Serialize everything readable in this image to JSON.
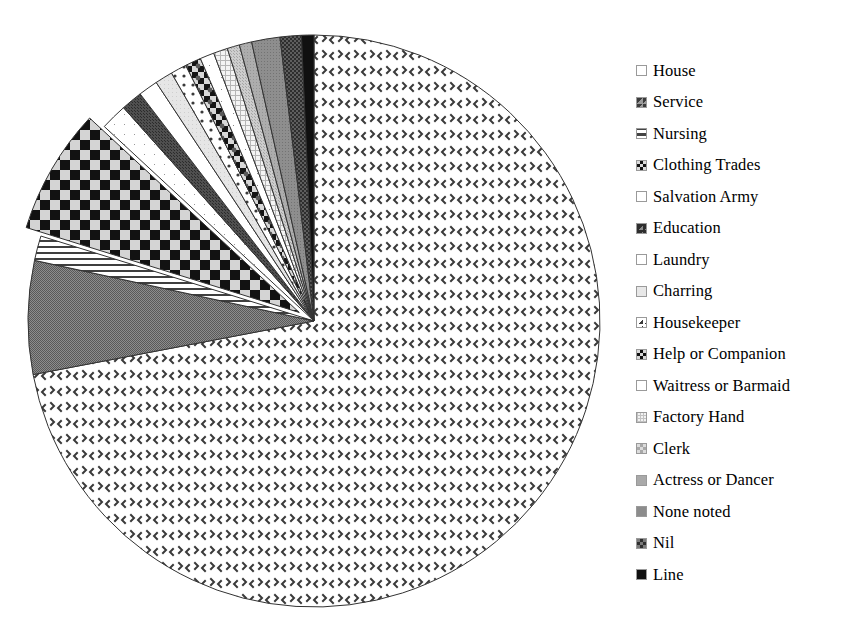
{
  "chart_data": {
    "type": "pie",
    "title": "",
    "subtitle": "",
    "xlabel": "",
    "ylabel": "",
    "legend_position": "right",
    "grid": false,
    "exploded_slices": [
      "Clothing Trades"
    ],
    "start_angle_deg": 90,
    "direction": "clockwise",
    "categories": [
      "House",
      "Service",
      "Nursing",
      "Clothing Trades",
      "Salvation Army",
      "Education",
      "Laundry",
      "Charring",
      "Housekeeper",
      "Help or Companion",
      "Waitress or Barmaid",
      "Factory Hand",
      "Clerk",
      "Actress or Dancer",
      "None noted",
      "Nil",
      "Line"
    ],
    "values": [
      72.0,
      6.4,
      1.4,
      7.1,
      1.5,
      1.2,
      1.1,
      1.0,
      0.9,
      0.9,
      0.8,
      0.8,
      0.7,
      0.7,
      1.6,
      1.2,
      0.7
    ],
    "units": "percent",
    "slices": [
      {
        "label": "House",
        "value": 72.0,
        "pattern": "sparse-chevron-dots",
        "fill": "#ffffff",
        "ink": "#3a3a3a"
      },
      {
        "label": "Service",
        "value": 6.4,
        "pattern": "dense-dither-50",
        "fill": "#777777",
        "ink": "#555555"
      },
      {
        "label": "Nursing",
        "value": 1.4,
        "pattern": "horizontal-lines",
        "fill": "#ffffff",
        "ink": "#444444"
      },
      {
        "label": "Clothing Trades",
        "value": 7.1,
        "pattern": "checkerboard-large",
        "fill": "#d0d0d0",
        "ink": "#111111"
      },
      {
        "label": "Salvation Army",
        "value": 1.5,
        "pattern": "open-white",
        "fill": "#ffffff",
        "ink": "#888888"
      },
      {
        "label": "Education",
        "value": 1.2,
        "pattern": "dark-dither-solid",
        "fill": "#4a4a4a",
        "ink": "#303030"
      },
      {
        "label": "Laundry",
        "value": 1.1,
        "pattern": "blank",
        "fill": "#ffffff",
        "ink": "#999999"
      },
      {
        "label": "Charring",
        "value": 1.0,
        "pattern": "light-gray-flat",
        "fill": "#e2e2e2",
        "ink": "#9a9a9a"
      },
      {
        "label": "Housekeeper",
        "value": 0.9,
        "pattern": "corner-block",
        "fill": "#ffffff",
        "ink": "#3a3a3a"
      },
      {
        "label": "Help or Companion",
        "value": 0.9,
        "pattern": "diagonal-checker-dark",
        "fill": "#cccccc",
        "ink": "#101010"
      },
      {
        "label": "Waitress or Barmaid",
        "value": 0.8,
        "pattern": "open-white",
        "fill": "#ffffff",
        "ink": "#8a8a8a"
      },
      {
        "label": "Factory Hand",
        "value": 0.8,
        "pattern": "fine-grid",
        "fill": "#f0f0f0",
        "ink": "#b0b0b0"
      },
      {
        "label": "Clerk",
        "value": 0.7,
        "pattern": "mid-gray-dither",
        "fill": "#c8c8c8",
        "ink": "#a0a0a0"
      },
      {
        "label": "Actress or Dancer",
        "value": 0.7,
        "pattern": "gray-flat",
        "fill": "#a8a8a8",
        "ink": "#909090"
      },
      {
        "label": "None noted",
        "value": 1.6,
        "pattern": "dark-gray-flat",
        "fill": "#8a8a8a",
        "ink": "#707070"
      },
      {
        "label": "Nil",
        "value": 1.2,
        "pattern": "dark-dither-checker",
        "fill": "#5a5a5a",
        "ink": "#404040"
      },
      {
        "label": "Line",
        "value": 0.7,
        "pattern": "solid-black",
        "fill": "#111111",
        "ink": "#000000"
      }
    ]
  },
  "legend": {
    "items": [
      {
        "label": "House",
        "swatch": "swatch-house"
      },
      {
        "label": "Service",
        "swatch": "swatch-service"
      },
      {
        "label": "Nursing",
        "swatch": "swatch-nursing"
      },
      {
        "label": "Clothing Trades",
        "swatch": "swatch-clothing-trades"
      },
      {
        "label": "Salvation Army",
        "swatch": "swatch-salvation-army"
      },
      {
        "label": "Education",
        "swatch": "swatch-education"
      },
      {
        "label": "Laundry",
        "swatch": "swatch-laundry"
      },
      {
        "label": "Charring",
        "swatch": "swatch-charring"
      },
      {
        "label": "Housekeeper",
        "swatch": "swatch-housekeeper"
      },
      {
        "label": "Help or Companion",
        "swatch": "swatch-help-or-companion"
      },
      {
        "label": "Waitress or Barmaid",
        "swatch": "swatch-waitress-or-barmaid"
      },
      {
        "label": "Factory Hand",
        "swatch": "swatch-factory-hand"
      },
      {
        "label": "Clerk",
        "swatch": "swatch-clerk"
      },
      {
        "label": "Actress or Dancer",
        "swatch": "swatch-actress-or-dancer"
      },
      {
        "label": "None noted",
        "swatch": "swatch-none-noted"
      },
      {
        "label": "Nil",
        "swatch": "swatch-nil"
      },
      {
        "label": "Line",
        "swatch": "swatch-line"
      }
    ]
  },
  "colors": {
    "outline": "#333333",
    "background": "#ffffff",
    "text": "#000000"
  }
}
